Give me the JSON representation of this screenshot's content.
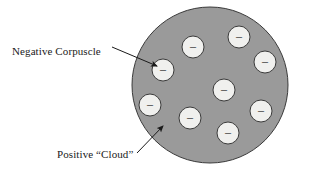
{
  "figure": {
    "background_color": "#ffffff"
  },
  "labels": {
    "negative_corpuscle": "Negative Corpuscle",
    "positive_cloud": "Positive “Cloud”"
  },
  "diagram": {
    "cloud": {
      "name": "positive-cloud",
      "shape": "circle",
      "cx": 210,
      "cy": 85,
      "r": 78,
      "fill": "#9a9a9a",
      "stroke": "#3a3a3a",
      "stroke_width": 1
    },
    "corpuscle_style": {
      "r": 11,
      "fill": "#f0f0ee",
      "stroke": "#3a3a3a",
      "stroke_width": 1,
      "sign": "–",
      "sign_color": "#2a2a2a"
    },
    "corpuscles": [
      {
        "id": "corpuscle-1",
        "cx": 163,
        "cy": 70
      },
      {
        "id": "corpuscle-2",
        "cx": 193,
        "cy": 47
      },
      {
        "id": "corpuscle-3",
        "cx": 239,
        "cy": 37
      },
      {
        "id": "corpuscle-4",
        "cx": 265,
        "cy": 62
      },
      {
        "id": "corpuscle-5",
        "cx": 224,
        "cy": 90
      },
      {
        "id": "corpuscle-6",
        "cx": 150,
        "cy": 105
      },
      {
        "id": "corpuscle-7",
        "cx": 190,
        "cy": 118
      },
      {
        "id": "corpuscle-8",
        "cx": 261,
        "cy": 111
      },
      {
        "id": "corpuscle-9",
        "cx": 228,
        "cy": 133
      }
    ],
    "leader_lines": [
      {
        "id": "leader-negative-corpuscle",
        "x1": 112,
        "y1": 47,
        "x2": 157,
        "y2": 66,
        "stroke": "#1a1a1a",
        "arrow": true
      },
      {
        "id": "leader-positive-cloud",
        "x1": 137,
        "y1": 153,
        "x2": 163,
        "y2": 126,
        "stroke": "#1a1a1a",
        "arrow": true
      }
    ]
  }
}
